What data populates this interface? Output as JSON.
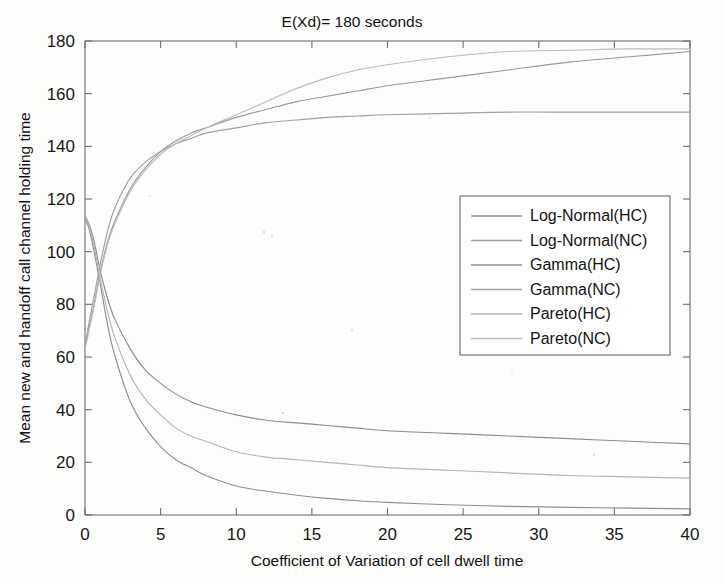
{
  "chart_data": {
    "type": "line",
    "title": "E(Xd)= 180 seconds",
    "xlabel": "Coefficient of Variation of cell dwell time",
    "ylabel": "Mean new and handoff call channel holding time",
    "xlim": [
      0,
      40
    ],
    "ylim": [
      0,
      180
    ],
    "xticks": [
      0,
      5,
      10,
      15,
      20,
      25,
      30,
      35,
      40
    ],
    "yticks": [
      0,
      20,
      40,
      60,
      80,
      100,
      120,
      140,
      160,
      180
    ],
    "grid": false,
    "legend_position": "center-right",
    "series": [
      {
        "name": "Log-Normal(HC)",
        "color": "#8c8c8c",
        "x": [
          0.05,
          0.3,
          0.6,
          1,
          1.5,
          2,
          3,
          4,
          5,
          6,
          7,
          8,
          10,
          12,
          14,
          16,
          18,
          20,
          24,
          28,
          32,
          36,
          40
        ],
        "values": [
          113,
          110,
          104,
          93,
          82,
          74,
          63,
          55,
          50,
          46,
          43,
          41,
          38,
          36,
          35,
          34,
          33,
          32,
          31,
          30,
          29,
          28,
          27
        ]
      },
      {
        "name": "Log-Normal(NC)",
        "color": "#9a9a9a",
        "x": [
          0.05,
          0.3,
          0.6,
          1,
          1.5,
          2,
          3,
          4,
          5,
          6,
          7,
          8,
          10,
          12,
          14,
          16,
          18,
          20,
          24,
          28,
          32,
          36,
          40
        ],
        "values": [
          65,
          72,
          80,
          92,
          104,
          112,
          124,
          132,
          138,
          142,
          145,
          147,
          151,
          154,
          157,
          159,
          161,
          163,
          166,
          169,
          172,
          174,
          176
        ]
      },
      {
        "name": "Gamma(HC)",
        "color": "#8f8f8f",
        "x": [
          0.05,
          0.3,
          0.6,
          1,
          1.5,
          2,
          3,
          4,
          5,
          6,
          7,
          8,
          10,
          12,
          14,
          16,
          18,
          20,
          24,
          28,
          32,
          36,
          40
        ],
        "values": [
          112,
          108,
          100,
          88,
          72,
          60,
          43,
          33,
          26,
          21,
          18,
          15,
          11,
          9,
          7.5,
          6.3,
          5.4,
          4.8,
          3.9,
          3.3,
          2.9,
          2.6,
          2.3
        ]
      },
      {
        "name": "Gamma(NC)",
        "color": "#a0a0a0",
        "x": [
          0.05,
          0.3,
          0.6,
          1,
          1.5,
          2,
          3,
          4,
          5,
          6,
          7,
          8,
          10,
          12,
          14,
          16,
          18,
          20,
          24,
          28,
          32,
          36,
          40
        ],
        "values": [
          66,
          74,
          83,
          95,
          108,
          117,
          128,
          134,
          138,
          141,
          143,
          145,
          147,
          149,
          150,
          151,
          151.5,
          152,
          152.5,
          153,
          153,
          153,
          153
        ]
      },
      {
        "name": "Pareto(HC)",
        "color": "#b4b4b4",
        "x": [
          0.05,
          0.3,
          0.6,
          1,
          1.5,
          2,
          3,
          4,
          5,
          6,
          7,
          8,
          10,
          12,
          14,
          16,
          18,
          20,
          24,
          28,
          32,
          36,
          40
        ],
        "values": [
          113,
          109,
          102,
          90,
          77,
          67,
          53,
          44,
          38,
          33,
          30,
          28,
          24,
          22,
          21,
          20,
          19,
          18,
          17,
          16,
          15,
          14.5,
          14
        ]
      },
      {
        "name": "Pareto(NC)",
        "color": "#bcbcbc",
        "x": [
          0.05,
          0.3,
          0.6,
          1,
          1.5,
          2,
          3,
          4,
          5,
          6,
          7,
          8,
          10,
          12,
          14,
          16,
          18,
          20,
          24,
          28,
          32,
          36,
          40
        ],
        "values": [
          64,
          71,
          79,
          91,
          103,
          111,
          123,
          131,
          137,
          141,
          144,
          147,
          152,
          157,
          162,
          166,
          169,
          171,
          174,
          176,
          176.5,
          177,
          177
        ]
      }
    ]
  },
  "legend": {
    "items": [
      {
        "label": "Log-Normal(HC)"
      },
      {
        "label": "Log-Normal(NC)"
      },
      {
        "label": "Gamma(HC)"
      },
      {
        "label": "Gamma(NC)"
      },
      {
        "label": "Pareto(HC)"
      },
      {
        "label": "Pareto(NC)"
      }
    ]
  },
  "axis": {
    "x_tick_labels": [
      "0",
      "5",
      "10",
      "15",
      "20",
      "25",
      "30",
      "35",
      "40"
    ],
    "y_tick_labels": [
      "0",
      "20",
      "40",
      "60",
      "80",
      "100",
      "120",
      "140",
      "160",
      "180"
    ]
  }
}
